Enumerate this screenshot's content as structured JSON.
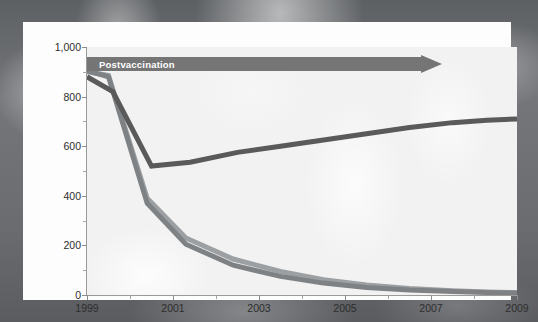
{
  "chart_data": {
    "type": "line",
    "title": "",
    "subtitle": "",
    "xlabel": "",
    "ylabel": "",
    "xlim": [
      1999,
      2009
    ],
    "ylim": [
      0,
      1000
    ],
    "xticks": [
      1999,
      2001,
      2003,
      2005,
      2007,
      2009
    ],
    "xticks_minor": [
      2000,
      2002,
      2004,
      2006,
      2008
    ],
    "yticks": [
      0,
      200,
      400,
      600,
      800,
      1000
    ],
    "yticks_minor": [
      100,
      300,
      500,
      700,
      900
    ],
    "ytick_labels": [
      "0",
      "200",
      "400",
      "600",
      "800",
      "1,000"
    ],
    "xtick_labels": [
      "1999",
      "2001",
      "2003",
      "2005",
      "2007",
      "2009"
    ],
    "grid": false,
    "legend": "none",
    "annotations": [
      {
        "name": "postvaccination-arrow",
        "text": "Postvaccination",
        "shape": "arrow",
        "x_start": 1999,
        "x_end": 2007.3,
        "y": 960,
        "color": "#757575",
        "text_color": "#ffffff"
      }
    ],
    "series": [
      {
        "name": "series-dark",
        "color": "#5a5a5a",
        "width": 5,
        "x": [
          1999,
          1999.6,
          2000.5,
          2001.4,
          2002.5,
          2003.5,
          2004.5,
          2005.5,
          2006.5,
          2007.5,
          2008.3,
          2009
        ],
        "values": [
          880,
          820,
          520,
          535,
          575,
          600,
          625,
          650,
          675,
          695,
          705,
          710
        ]
      },
      {
        "name": "series-mid-gray",
        "color": "#7f8285",
        "width": 5,
        "x": [
          1999,
          1999.5,
          2000.4,
          2001.3,
          2002.4,
          2003.5,
          2004.5,
          2005.5,
          2006.5,
          2007.5,
          2008.3,
          2009
        ],
        "values": [
          905,
          880,
          370,
          205,
          120,
          75,
          48,
          30,
          20,
          14,
          10,
          8
        ]
      },
      {
        "name": "series-light-gray",
        "color": "#9da0a3",
        "width": 5,
        "x": [
          1999,
          1999.5,
          2000.4,
          2001.3,
          2002.4,
          2003.5,
          2004.5,
          2005.5,
          2006.5,
          2007.5,
          2008.3,
          2009
        ],
        "values": [
          900,
          885,
          390,
          230,
          145,
          95,
          62,
          40,
          26,
          17,
          12,
          9
        ]
      }
    ]
  },
  "background": {
    "name": "ct-scan-photo",
    "description": ""
  }
}
